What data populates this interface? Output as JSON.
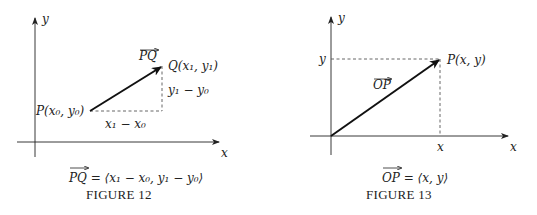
{
  "figure12": {
    "caption": "FIGURE 12",
    "axis_x_label": "x",
    "axis_y_label": "y",
    "vector_label": "PQ",
    "point_P_label": "P(x₀, y₀)",
    "point_Q_label": "Q(x₁, y₁)",
    "dx_label": "x₁ − x₀",
    "dy_label": "y₁ − y₀",
    "equation": "PQ = ⟨x₁ − x₀, y₁ − y₀⟩"
  },
  "figure13": {
    "caption": "FIGURE 13",
    "axis_x_label": "x",
    "axis_y_label": "y",
    "vector_label": "OP",
    "point_P_label": "P(x, y)",
    "tick_x_label": "x",
    "tick_y_label": "y",
    "equation": "OP = ⟨x, y⟩"
  },
  "colors": {
    "ink": "#222222",
    "dashed": "#555555"
  }
}
